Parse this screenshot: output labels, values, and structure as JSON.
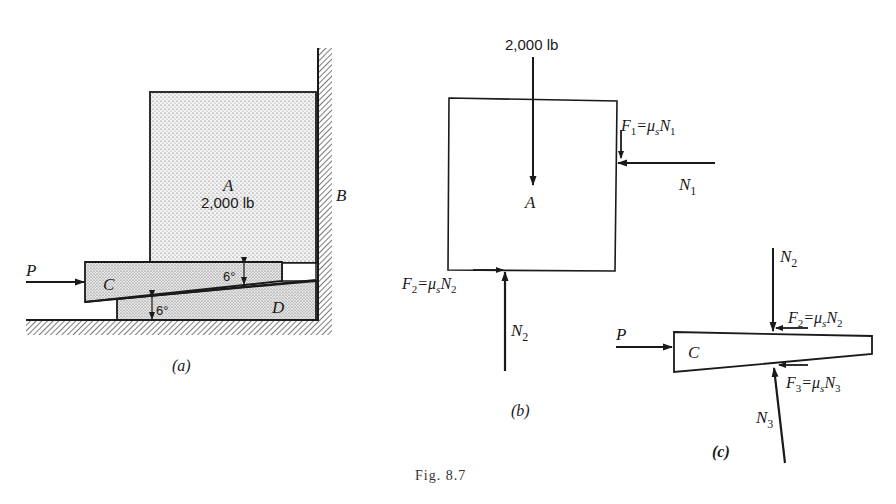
{
  "figure": {
    "caption": "Fig. 8.7",
    "colors": {
      "ink": "#1a1a1a",
      "stipple_fill": "#e3e3e3",
      "background": "#ffffff"
    }
  },
  "panel_a": {
    "label": "(a)",
    "block_a": {
      "name": "A",
      "weight": "2,000 lb"
    },
    "wall": {
      "name": "B"
    },
    "wedge_c": {
      "name": "C"
    },
    "wedge_d": {
      "name": "D"
    },
    "force_p": "P",
    "angle_upper": "6°",
    "angle_lower": "6°"
  },
  "panel_b": {
    "label": "(b)",
    "block_name": "A",
    "weight_force": "2,000 lb",
    "f1": {
      "sym": "F",
      "sub": "1",
      "eq": "=μ",
      "mu_sub": "s",
      "n": "N",
      "n_sub": "1"
    },
    "n1": {
      "sym": "N",
      "sub": "1"
    },
    "f2": {
      "sym": "F",
      "sub": "2",
      "eq": "=μ",
      "mu_sub": "s",
      "n": "N",
      "n_sub": "2"
    },
    "n2": {
      "sym": "N",
      "sub": "2"
    }
  },
  "panel_c": {
    "label": "(c)",
    "wedge_name": "C",
    "force_p": "P",
    "n2": {
      "sym": "N",
      "sub": "2"
    },
    "f2": {
      "sym": "F",
      "sub": "2",
      "eq": "=μ",
      "mu_sub": "s",
      "n": "N",
      "n_sub": "2"
    },
    "f3": {
      "sym": "F",
      "sub": "3",
      "eq": "=μ",
      "mu_sub": "s",
      "n": "N",
      "n_sub": "3"
    },
    "n3": {
      "sym": "N",
      "sub": "3"
    }
  }
}
